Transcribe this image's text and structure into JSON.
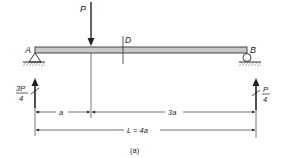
{
  "figure": {
    "caption": "(a)",
    "beam": {
      "left_support_label": "A",
      "right_support_label": "B",
      "section_label": "D",
      "left_support_type": "pin",
      "right_support_type": "roller",
      "fill_color": "#c8c8c8"
    },
    "loads": {
      "applied_load_label": "P"
    },
    "reactions": {
      "left": {
        "numerator": "3P",
        "denominator": "4"
      },
      "right": {
        "numerator": "P",
        "denominator": "4"
      }
    },
    "dimensions": {
      "left_segment": "a",
      "right_segment": "3a",
      "total_length": "L = 4a"
    }
  }
}
